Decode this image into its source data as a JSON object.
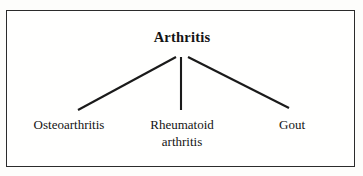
{
  "diagram": {
    "type": "tree",
    "title": "Arthritis",
    "root": {
      "label": "Arthritis",
      "emphasis": "bold"
    },
    "children": [
      {
        "label": "Osteoarthritis",
        "lines": [
          "Osteoarthritis"
        ]
      },
      {
        "label": "Rheumatoid arthritis",
        "lines": [
          "Rheumatoid",
          "arthritis"
        ]
      },
      {
        "label": "Gout",
        "lines": [
          "Gout"
        ]
      }
    ],
    "leaf_labels": {
      "left_line1": "Osteoarthritis",
      "middle_line1": "Rheumatoid",
      "middle_line2": "arthritis",
      "right_line1": "Gout"
    },
    "colors": {
      "line": "#1a1a1a",
      "border": "#2b2b2b",
      "text": "#141414",
      "background": "#fffffe"
    },
    "connectors": [
      {
        "name": "root-to-osteoarthritis",
        "x1": 176,
        "y1": 57,
        "x2": 78,
        "y2": 110
      },
      {
        "name": "root-to-rheumatoid",
        "x1": 181,
        "y1": 57,
        "x2": 181,
        "y2": 110
      },
      {
        "name": "root-to-gout",
        "x1": 188,
        "y1": 57,
        "x2": 289,
        "y2": 108
      }
    ]
  }
}
